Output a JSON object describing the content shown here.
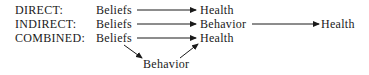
{
  "rows": [
    {
      "label": "DIRECT:",
      "nodes": [
        "Beliefs",
        "Health"
      ]
    },
    {
      "label": "INDIRECT:",
      "nodes": [
        "Beliefs",
        "Behavior",
        "Health"
      ]
    },
    {
      "label": "COMBINED:",
      "nodes": [
        "Beliefs",
        "Health",
        "Behavior"
      ]
    }
  ],
  "edges": [
    {
      "row": "DIRECT",
      "from": "Beliefs",
      "to": "Health"
    },
    {
      "row": "INDIRECT",
      "from": "Beliefs",
      "to": "Behavior"
    },
    {
      "row": "INDIRECT",
      "from": "Behavior",
      "to": "Health"
    },
    {
      "row": "COMBINED",
      "from": "Beliefs",
      "to": "Health"
    },
    {
      "row": "COMBINED",
      "from": "Beliefs",
      "to": "Behavior"
    },
    {
      "row": "COMBINED",
      "from": "Behavior",
      "to": "Health"
    }
  ]
}
